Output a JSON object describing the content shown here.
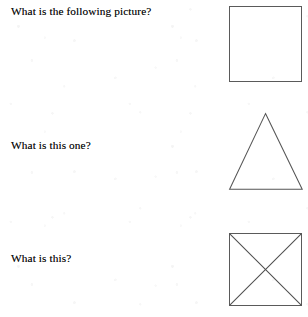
{
  "document": {
    "kind": "scanned-worksheet",
    "background_color": "#ffffff",
    "ink_color": "#0d0d0d",
    "figure_stroke_color": "#5a5a5a"
  },
  "questions": [
    {
      "id": "q1",
      "prompt": "What is the following picture?",
      "figure": {
        "name": "square",
        "label": "square"
      }
    },
    {
      "id": "q2",
      "prompt": "What is this one?",
      "figure": {
        "name": "triangle",
        "label": "triangle"
      }
    },
    {
      "id": "q3",
      "prompt": "What is this?",
      "figure": {
        "name": "square-with-diagonals",
        "label": "square with crossed diagonals"
      }
    }
  ]
}
